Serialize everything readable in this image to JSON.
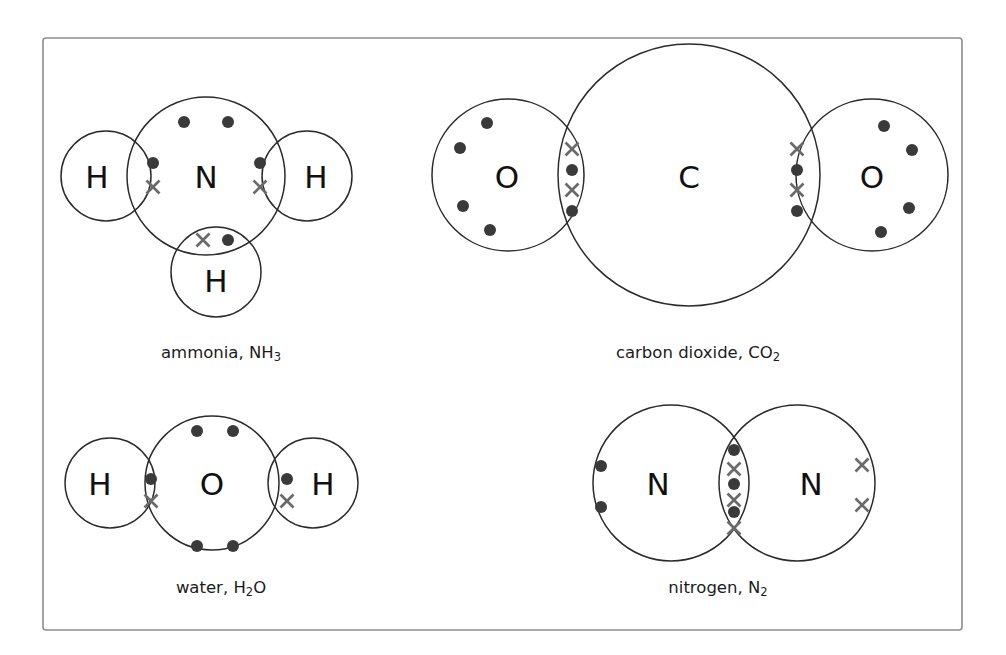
{
  "figure": {
    "background_color": "#ffffff",
    "frame": {
      "name": "figure-border",
      "x": 43,
      "y": 38,
      "width": 919,
      "height": 592,
      "stroke_color": "#8d8d8d"
    },
    "style": {
      "dot_color": "#3a3a3a",
      "cross_color": "#6a6a6a",
      "shell_stroke_color": "#2b2b2b",
      "label_color": "#111111",
      "dot_radius": 6.0,
      "cross_arm": 6.5
    }
  },
  "chart_data": {
    "type": "diagram",
    "subtype": "dot-and-cross covalent bonding diagram",
    "panel_count": 4,
    "legend": {
      "dot": "electron from central atom",
      "cross": "electron from bonded atom"
    },
    "molecules": [
      {
        "id": "ammonia",
        "caption_name": "ammonia",
        "caption_formula_base": "NH",
        "caption_formula_sub": "3",
        "caption": "ammonia, NH3",
        "caption_x": 221,
        "caption_y": 352,
        "atoms": [
          {
            "symbol": "N",
            "role": "central",
            "cx": 206,
            "cy": 176,
            "r": 79,
            "label_x": 206,
            "label_y": 177
          },
          {
            "symbol": "H",
            "role": "terminal",
            "cx": 106,
            "cy": 176,
            "r": 45,
            "label_x": 97,
            "label_y": 177
          },
          {
            "symbol": "H",
            "role": "terminal",
            "cx": 307,
            "cy": 176,
            "r": 45,
            "label_x": 316,
            "label_y": 177
          },
          {
            "symbol": "H",
            "role": "terminal",
            "cx": 216,
            "cy": 272,
            "r": 45,
            "label_x": 216,
            "label_y": 281
          }
        ],
        "lone_pairs": [
          {
            "type": "dot",
            "x": 184,
            "y": 122
          },
          {
            "type": "dot",
            "x": 228,
            "y": 122
          }
        ],
        "bond_pairs": [
          {
            "electrons": [
              {
                "type": "dot",
                "x": 153,
                "y": 163
              },
              {
                "type": "cross",
                "x": 153,
                "y": 187
              }
            ]
          },
          {
            "electrons": [
              {
                "type": "dot",
                "x": 260,
                "y": 163
              },
              {
                "type": "cross",
                "x": 260,
                "y": 187
              }
            ]
          },
          {
            "electrons": [
              {
                "type": "cross",
                "x": 203,
                "y": 240
              },
              {
                "type": "dot",
                "x": 228,
                "y": 240
              }
            ]
          }
        ]
      },
      {
        "id": "carbon-dioxide",
        "caption_name": "carbon dioxide",
        "caption_formula_base": "CO",
        "caption_formula_sub": "2",
        "caption": "carbon dioxide, CO2",
        "caption_x": 698,
        "caption_y": 352,
        "atoms": [
          {
            "symbol": "C",
            "role": "central",
            "cx": 689,
            "cy": 175,
            "r": 131,
            "label_x": 689,
            "label_y": 177
          },
          {
            "symbol": "O",
            "role": "terminal",
            "cx": 508,
            "cy": 175,
            "r": 76,
            "label_x": 507,
            "label_y": 177
          },
          {
            "symbol": "O",
            "role": "terminal",
            "cx": 872,
            "cy": 175,
            "r": 76,
            "label_x": 872,
            "label_y": 177
          }
        ],
        "lone_pairs": [
          {
            "type": "dot",
            "x": 487,
            "y": 123
          },
          {
            "type": "dot",
            "x": 460,
            "y": 148
          },
          {
            "type": "dot",
            "x": 463,
            "y": 206
          },
          {
            "type": "dot",
            "x": 490,
            "y": 230
          },
          {
            "type": "dot",
            "x": 884,
            "y": 126
          },
          {
            "type": "dot",
            "x": 912,
            "y": 150
          },
          {
            "type": "dot",
            "x": 909,
            "y": 208
          },
          {
            "type": "dot",
            "x": 881,
            "y": 232
          }
        ],
        "bond_pairs": [
          {
            "electrons": [
              {
                "type": "cross",
                "x": 572,
                "y": 149
              },
              {
                "type": "dot",
                "x": 572,
                "y": 170
              },
              {
                "type": "cross",
                "x": 572,
                "y": 190
              },
              {
                "type": "dot",
                "x": 572,
                "y": 211
              }
            ]
          },
          {
            "electrons": [
              {
                "type": "cross",
                "x": 797,
                "y": 149
              },
              {
                "type": "dot",
                "x": 797,
                "y": 170
              },
              {
                "type": "cross",
                "x": 797,
                "y": 190
              },
              {
                "type": "dot",
                "x": 797,
                "y": 211
              }
            ]
          }
        ]
      },
      {
        "id": "water",
        "caption_name": "water",
        "caption_formula_base": "H",
        "caption_formula_sub": "2",
        "caption_formula_tail": "O",
        "caption": "water, H2O",
        "caption_x": 221,
        "caption_y": 587,
        "atoms": [
          {
            "symbol": "O",
            "role": "central",
            "cx": 212,
            "cy": 483,
            "r": 67,
            "label_x": 212,
            "label_y": 484
          },
          {
            "symbol": "H",
            "role": "terminal",
            "cx": 110,
            "cy": 483,
            "r": 45,
            "label_x": 100,
            "label_y": 484
          },
          {
            "symbol": "H",
            "role": "terminal",
            "cx": 313,
            "cy": 483,
            "r": 45,
            "label_x": 323,
            "label_y": 484
          }
        ],
        "lone_pairs": [
          {
            "type": "dot",
            "x": 197,
            "y": 431
          },
          {
            "type": "dot",
            "x": 233,
            "y": 431
          },
          {
            "type": "dot",
            "x": 197,
            "y": 546
          },
          {
            "type": "dot",
            "x": 233,
            "y": 546
          }
        ],
        "bond_pairs": [
          {
            "electrons": [
              {
                "type": "dot",
                "x": 151,
                "y": 479
              },
              {
                "type": "cross",
                "x": 151,
                "y": 501
              }
            ]
          },
          {
            "electrons": [
              {
                "type": "dot",
                "x": 287,
                "y": 479
              },
              {
                "type": "cross",
                "x": 287,
                "y": 501
              }
            ]
          }
        ]
      },
      {
        "id": "nitrogen",
        "caption_name": "nitrogen",
        "caption_formula_base": "N",
        "caption_formula_sub": "2",
        "caption": "nitrogen, N2",
        "caption_x": 718,
        "caption_y": 587,
        "atoms": [
          {
            "symbol": "N",
            "role": "left",
            "cx": 671,
            "cy": 483,
            "r": 78,
            "label_x": 658,
            "label_y": 484
          },
          {
            "symbol": "N",
            "role": "right",
            "cx": 797,
            "cy": 483,
            "r": 78,
            "label_x": 811,
            "label_y": 484
          }
        ],
        "lone_pairs": [
          {
            "type": "dot",
            "x": 601,
            "y": 466
          },
          {
            "type": "dot",
            "x": 601,
            "y": 507
          },
          {
            "type": "cross",
            "x": 862,
            "y": 465
          },
          {
            "type": "cross",
            "x": 862,
            "y": 505
          }
        ],
        "bond_pairs": [
          {
            "electrons": [
              {
                "type": "dot",
                "x": 734,
                "y": 450
              },
              {
                "type": "cross",
                "x": 734,
                "y": 469
              },
              {
                "type": "dot",
                "x": 734,
                "y": 484
              },
              {
                "type": "cross",
                "x": 734,
                "y": 500
              },
              {
                "type": "dot",
                "x": 734,
                "y": 512
              },
              {
                "type": "cross",
                "x": 734,
                "y": 528
              }
            ]
          }
        ]
      }
    ]
  }
}
